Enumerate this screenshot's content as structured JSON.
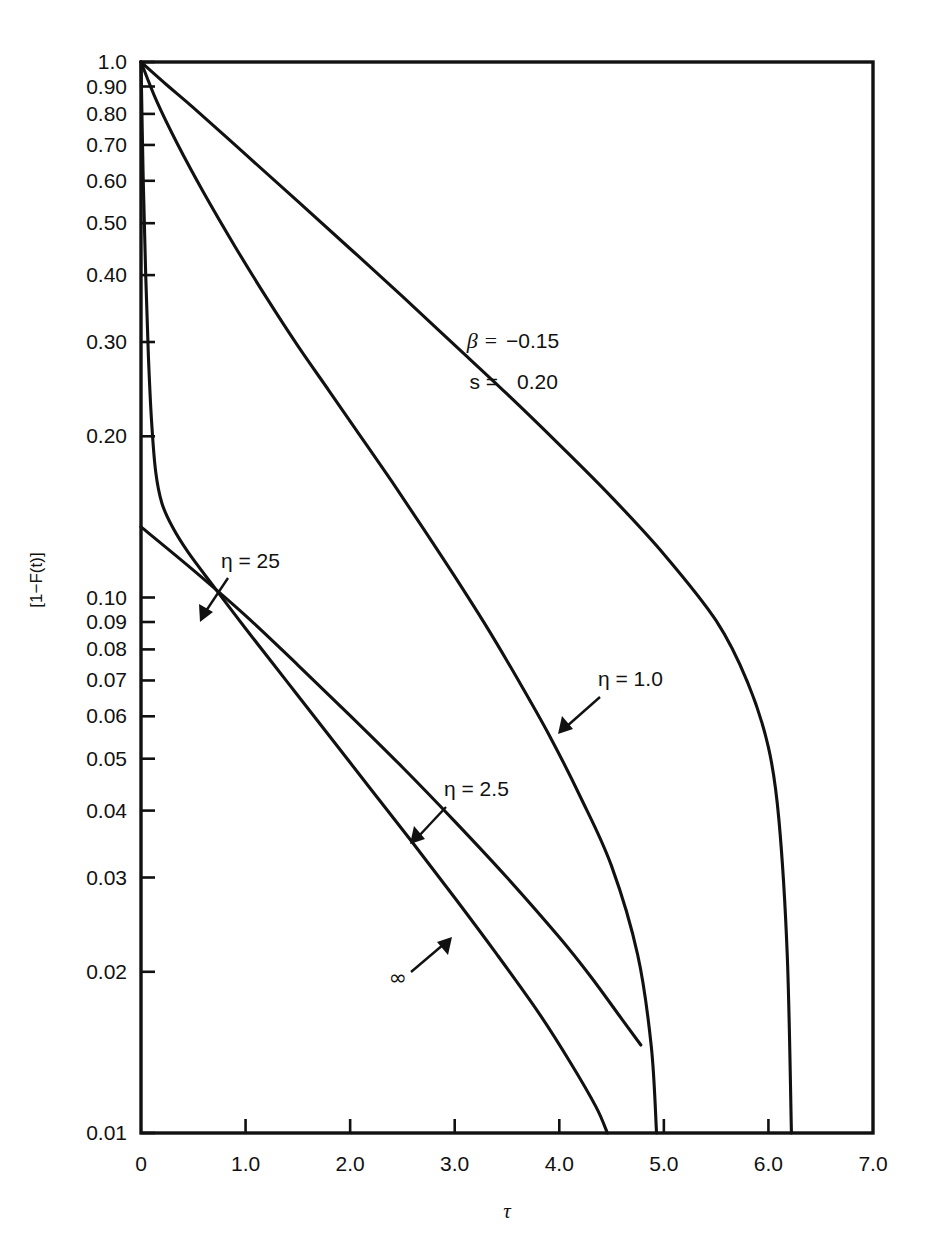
{
  "figure": {
    "background": "#ffffff",
    "ink_color": "#111111"
  },
  "axes": {
    "y_axis_label": "[1−F(t)]",
    "x_axis_label": "τ",
    "y_scale": "log",
    "x_scale": "linear",
    "y_tick_labels": [
      "1.0",
      "0.90",
      "0.80",
      "0.70",
      "0.60",
      "0.50",
      "0.40",
      "0.30",
      "0.20",
      "0.10",
      "0.09",
      "0.08",
      "0.07",
      "0.06",
      "0.05",
      "0.04",
      "0.03",
      "0.02",
      "0.01"
    ],
    "y_tick_values": [
      1.0,
      0.9,
      0.8,
      0.7,
      0.6,
      0.5,
      0.4,
      0.3,
      0.2,
      0.1,
      0.09,
      0.08,
      0.07,
      0.06,
      0.05,
      0.04,
      0.03,
      0.02,
      0.01
    ],
    "x_tick_labels": [
      "0",
      "1.0",
      "2.0",
      "3.0",
      "4.0",
      "5.0",
      "6.0",
      "7.0"
    ],
    "x_tick_values": [
      0,
      1.0,
      2.0,
      3.0,
      4.0,
      5.0,
      6.0,
      7.0
    ]
  },
  "parameters": {
    "beta_label": "β =",
    "beta_value": "−0.15",
    "s_label": "s =",
    "s_value": "0.20"
  },
  "curve_labels": {
    "eta_25": "η = 25",
    "eta_1": "η = 1.0",
    "eta_25_half": "η = 2.5",
    "infinity": "∞"
  },
  "chart_data": {
    "type": "line",
    "title": "",
    "xlabel": "τ",
    "ylabel": "[1−F(t)]",
    "xlim": [
      0,
      7.0
    ],
    "ylim": [
      0.01,
      1.0
    ],
    "yscale": "log",
    "grid": false,
    "legend": "inline-annotations",
    "annotations": [
      {
        "text": "β = −0.15",
        "x": 3.1,
        "y": 0.31
      },
      {
        "text": "s =  0.20",
        "x": 3.1,
        "y": 0.245
      },
      {
        "text": "η = 25",
        "x": 0.75,
        "y": 0.128,
        "arrow_to": {
          "x": 0.46,
          "y": 0.099
        }
      },
      {
        "text": "η = 1.0",
        "x": 4.35,
        "y": 0.069,
        "arrow_to": {
          "x": 4.05,
          "y": 0.055
        }
      },
      {
        "text": "η = 2.5",
        "x": 3.1,
        "y": 0.0465,
        "arrow_to": {
          "x": 2.82,
          "y": 0.0375
        }
      },
      {
        "text": "∞",
        "x": 2.02,
        "y": 0.0197,
        "arrow_to": {
          "x": 2.45,
          "y": 0.0245
        }
      }
    ],
    "series": [
      {
        "name": "η = 1.0",
        "points": [
          [
            0.0,
            1.0
          ],
          [
            0.25,
            0.905
          ],
          [
            0.5,
            0.822
          ],
          [
            1.0,
            0.672
          ],
          [
            1.5,
            0.549
          ],
          [
            2.0,
            0.448
          ],
          [
            2.5,
            0.365
          ],
          [
            3.0,
            0.296
          ],
          [
            3.5,
            0.24
          ],
          [
            4.0,
            0.193
          ],
          [
            4.5,
            0.154
          ],
          [
            5.0,
            0.1205
          ],
          [
            5.5,
            0.0905
          ],
          [
            5.8,
            0.0695
          ],
          [
            6.0,
            0.0525
          ],
          [
            6.1,
            0.0385
          ],
          [
            6.18,
            0.0215
          ],
          [
            6.22,
            0.01
          ]
        ]
      },
      {
        "name": "η = 2.5",
        "points": [
          [
            0.0,
            1.0
          ],
          [
            0.15,
            0.845
          ],
          [
            0.35,
            0.702
          ],
          [
            0.6,
            0.57
          ],
          [
            0.9,
            0.452
          ],
          [
            1.2,
            0.363
          ],
          [
            1.5,
            0.295
          ],
          [
            1.8,
            0.243
          ],
          [
            2.1,
            0.2
          ],
          [
            2.4,
            0.1645
          ],
          [
            2.7,
            0.1345
          ],
          [
            3.0,
            0.1095
          ],
          [
            3.3,
            0.0885
          ],
          [
            3.6,
            0.0705
          ],
          [
            3.9,
            0.0555
          ],
          [
            4.2,
            0.0425
          ],
          [
            4.5,
            0.0315
          ],
          [
            4.75,
            0.0215
          ],
          [
            4.88,
            0.0145
          ],
          [
            4.93,
            0.01
          ]
        ]
      },
      {
        "name": "η = 25",
        "points": [
          [
            0.0,
            1.0
          ],
          [
            0.02,
            0.62
          ],
          [
            0.045,
            0.4
          ],
          [
            0.07,
            0.285
          ],
          [
            0.1,
            0.215
          ],
          [
            0.14,
            0.172
          ],
          [
            0.2,
            0.15
          ],
          [
            0.3,
            0.1355
          ],
          [
            0.45,
            0.1215
          ],
          [
            0.7,
            0.1045
          ],
          [
            1.0,
            0.0875
          ],
          [
            1.4,
            0.0695
          ],
          [
            1.8,
            0.0552
          ],
          [
            2.2,
            0.0438
          ],
          [
            2.6,
            0.0348
          ],
          [
            3.0,
            0.0275
          ],
          [
            3.4,
            0.0216
          ],
          [
            3.8,
            0.0168
          ],
          [
            4.1,
            0.0136
          ],
          [
            4.35,
            0.0112
          ],
          [
            4.46,
            0.01
          ]
        ]
      },
      {
        "name": "∞",
        "points": [
          [
            0.0,
            0.1355
          ],
          [
            0.5,
            0.1125
          ],
          [
            1.0,
            0.0925
          ],
          [
            1.5,
            0.0748
          ],
          [
            2.0,
            0.0602
          ],
          [
            2.5,
            0.0482
          ],
          [
            3.0,
            0.0382
          ],
          [
            3.5,
            0.03
          ],
          [
            4.0,
            0.0232
          ],
          [
            4.3,
            0.0196
          ],
          [
            4.6,
            0.0163
          ],
          [
            4.78,
            0.0146
          ]
        ]
      }
    ]
  }
}
